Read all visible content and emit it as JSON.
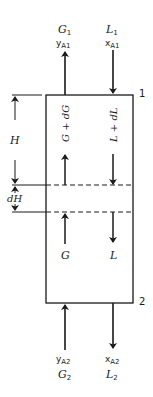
{
  "diagram": {
    "top_section_marker": "1",
    "bottom_section_marker": "2",
    "top_gas_out": {
      "flow": "G",
      "flow_sub": "1",
      "comp": "y",
      "comp_sub": "A1"
    },
    "top_liquid_in": {
      "flow": "L",
      "flow_sub": "1",
      "comp": "x",
      "comp_sub": "A1"
    },
    "bottom_gas_in": {
      "flow": "G",
      "flow_sub": "2",
      "comp": "y",
      "comp_sub": "A2"
    },
    "bottom_liquid_out": {
      "flow": "L",
      "flow_sub": "2",
      "comp": "x",
      "comp_sub": "A2"
    },
    "inner_gas_upper": "G + dG",
    "inner_liquid_upper": "L + dL",
    "inner_gas_lower": "G",
    "inner_liquid_lower": "L",
    "height_label": "H",
    "diff_height_label": "dH"
  }
}
